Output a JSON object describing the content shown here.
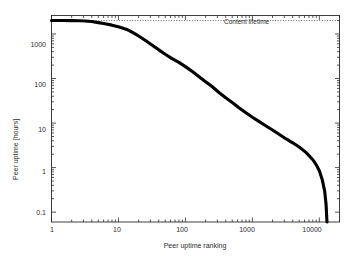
{
  "chart_data": {
    "type": "line",
    "title": "",
    "xlabel": "Peer uptime ranking",
    "ylabel": "Peer uptime [hours]",
    "xscale": "log",
    "yscale": "log",
    "xlim": [
      1,
      20000
    ],
    "ylim": [
      0.06,
      2600
    ],
    "grid": false,
    "legend": null,
    "xticks": [
      "1",
      "10",
      "100",
      "1000",
      "10000"
    ],
    "xtick_values": [
      1,
      10,
      100,
      1000,
      10000
    ],
    "yticks": [
      "1000",
      "100",
      "10",
      "1",
      "0.1"
    ],
    "ytick_values": [
      1000,
      100,
      10,
      1,
      0.1
    ],
    "annotations": [
      {
        "name": "content-lifetime",
        "text": "Content lifetime",
        "type": "horizontal-line",
        "y_value": 2000,
        "style": "dotted"
      }
    ],
    "series": [
      {
        "name": "Peer uptime distribution",
        "style": "solid-thick-black",
        "color": "#000000",
        "x": [
          1,
          1.5,
          2,
          2.6,
          3.2,
          4,
          5,
          6.3,
          8,
          10,
          13,
          16,
          20,
          25,
          32,
          40,
          50,
          63,
          80,
          100,
          130,
          160,
          200,
          250,
          320,
          400,
          500,
          630,
          800,
          1000,
          1300,
          1600,
          2000,
          2500,
          3200,
          4000,
          5000,
          6300,
          8000,
          9000,
          10000,
          11000,
          12000,
          12600,
          13000
        ],
        "y": [
          2000,
          2000,
          1990,
          1980,
          1960,
          1900,
          1800,
          1700,
          1580,
          1450,
          1280,
          1100,
          900,
          720,
          560,
          440,
          350,
          280,
          230,
          185,
          140,
          110,
          85,
          66,
          48,
          37,
          29,
          22,
          17,
          13.5,
          10.5,
          8.6,
          7.0,
          5.6,
          4.4,
          3.6,
          2.9,
          2.2,
          1.5,
          1.15,
          0.85,
          0.55,
          0.3,
          0.15,
          0.06
        ]
      }
    ],
    "colors": {
      "curve": "#000000",
      "axis": "#2b2b2b",
      "annotation_line": "#3a3a3a",
      "background": "#ffffff"
    }
  }
}
